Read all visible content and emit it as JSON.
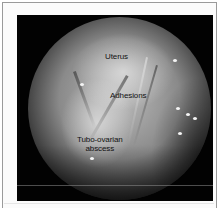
{
  "figure": {
    "type": "laparoscopic-photograph",
    "labels": {
      "uterus": "Uterus",
      "adhesions": "Adhesions",
      "abscess_line1": "Tubo-ovarian",
      "abscess_line2": "abscess"
    }
  },
  "colors": {
    "frame_border": "#9a9a9a",
    "background": "#020202",
    "label_text": "#111111"
  }
}
